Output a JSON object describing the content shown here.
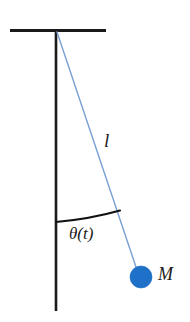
{
  "figure": {
    "background_color": "#ffffff"
  },
  "labels": {
    "length": "l",
    "angle": "θ(t)",
    "mass": "M"
  },
  "colors": {
    "structure": "#1a1a1a",
    "string": "#7a9fd4",
    "bob_fill": "#1f70c8",
    "bob_stroke": "#1f70c8",
    "arc": "#111111",
    "background": "#ffffff"
  },
  "geometry": {
    "ceiling_bar": {
      "x1": 10,
      "y1": 30.5,
      "x2": 106,
      "y2": 30.5,
      "width": 3
    },
    "vertical_rod": {
      "x1": 56,
      "y1": 30,
      "x2": 56,
      "y2": 311,
      "width": 2.6
    },
    "string": {
      "x1": 57,
      "y1": 32,
      "x2": 136,
      "y2": 269,
      "width": 1.3
    },
    "bob": {
      "cx": 141,
      "cy": 277,
      "r": 11
    },
    "angle_arc": {
      "start_x": 56,
      "start_y": 222,
      "end_x": 120,
      "end_y": 210.5,
      "width": 2.2
    }
  },
  "icons": {
    "bob": "filled-circle-icon",
    "support": "ceiling-bar-icon",
    "rod": "vertical-reference-line-icon",
    "arc": "angle-arc-icon"
  }
}
